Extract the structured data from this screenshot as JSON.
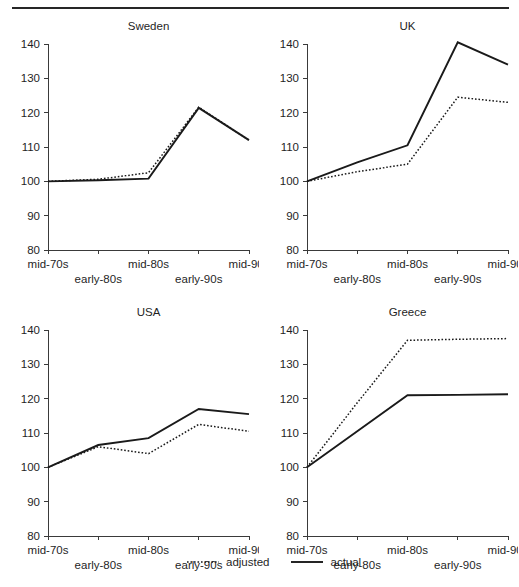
{
  "figure": {
    "has_top_rule": true,
    "ink_color": "#1a1a1a",
    "axis_color": "#3a3a3a"
  },
  "legend": {
    "entries": [
      {
        "label": "adjusted",
        "style": "dotted",
        "name": "legend-adjusted"
      },
      {
        "label": "actual",
        "style": "solid",
        "name": "legend-actual"
      }
    ]
  },
  "chart_data": [
    {
      "type": "line",
      "title": "Sweden",
      "xlabel": "",
      "ylabel": "",
      "ylim": [
        80,
        140
      ],
      "yticks": [
        80,
        90,
        100,
        110,
        120,
        130,
        140
      ],
      "grid": false,
      "legend_position": "below-figure",
      "categories": [
        "mid-70s",
        "early-80s",
        "mid-80s",
        "early-90s",
        "mid-90s"
      ],
      "series": [
        {
          "name": "adjusted",
          "style": "dotted",
          "values": [
            100,
            100.6,
            102.5,
            121.6,
            112
          ]
        },
        {
          "name": "actual",
          "style": "solid",
          "values": [
            100,
            100.3,
            100.8,
            121.4,
            112
          ]
        }
      ]
    },
    {
      "type": "line",
      "title": "UK",
      "xlabel": "",
      "ylabel": "",
      "ylim": [
        80,
        140
      ],
      "yticks": [
        80,
        90,
        100,
        110,
        120,
        130,
        140
      ],
      "grid": false,
      "legend_position": "below-figure",
      "categories": [
        "mid-70s",
        "early-80s",
        "mid-80s",
        "early-90s",
        "mid-90s"
      ],
      "series": [
        {
          "name": "adjusted",
          "style": "dotted",
          "values": [
            100,
            102.8,
            105,
            124.5,
            123
          ]
        },
        {
          "name": "actual",
          "style": "solid",
          "values": [
            100,
            105.5,
            110.5,
            140.5,
            134
          ]
        }
      ]
    },
    {
      "type": "line",
      "title": "USA",
      "xlabel": "",
      "ylabel": "",
      "ylim": [
        80,
        140
      ],
      "yticks": [
        80,
        90,
        100,
        110,
        120,
        130,
        140
      ],
      "grid": false,
      "legend_position": "below-figure",
      "categories": [
        "mid-70s",
        "early-80s",
        "mid-80s",
        "early-90s",
        "mid-90s"
      ],
      "series": [
        {
          "name": "adjusted",
          "style": "dotted",
          "values": [
            100,
            106,
            104,
            112.5,
            110.5
          ]
        },
        {
          "name": "actual",
          "style": "solid",
          "values": [
            100,
            106.5,
            108.5,
            117,
            115.5
          ]
        }
      ]
    },
    {
      "type": "line",
      "title": "Greece",
      "xlabel": "",
      "ylabel": "",
      "ylim": [
        80,
        140
      ],
      "yticks": [
        80,
        90,
        100,
        110,
        120,
        130,
        140
      ],
      "grid": false,
      "legend_position": "below-figure",
      "categories": [
        "mid-70s",
        "early-80s",
        "mid-80s",
        "early-90s",
        "mid-90s"
      ],
      "series": [
        {
          "name": "adjusted",
          "style": "dotted",
          "values": [
            100,
            118.8,
            137,
            137.3,
            137.5
          ]
        },
        {
          "name": "actual",
          "style": "solid",
          "values": [
            100,
            110.5,
            121,
            121.1,
            121.3
          ]
        }
      ]
    }
  ]
}
